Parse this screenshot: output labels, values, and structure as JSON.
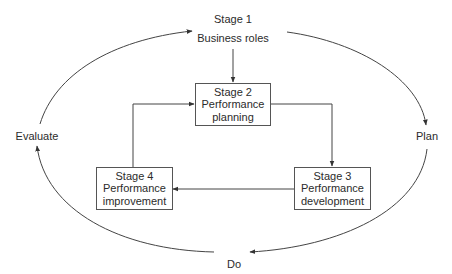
{
  "diagram": {
    "type": "cycle-flow",
    "outer_cycle": {
      "stage1": {
        "title": "Stage 1",
        "subtitle": "Business roles"
      },
      "phases": [
        {
          "label": "Plan"
        },
        {
          "label": "Do"
        },
        {
          "label": "Evaluate"
        }
      ]
    },
    "inner_cycle": {
      "boxes": [
        {
          "id": "stage2",
          "title": "Stage 2",
          "line1": "Performance",
          "line2": "planning"
        },
        {
          "id": "stage3",
          "title": "Stage 3",
          "line1": "Performance",
          "line2": "development"
        },
        {
          "id": "stage4",
          "title": "Stage 4",
          "line1": "Performance",
          "line2": "improvement"
        }
      ]
    },
    "edges": [
      {
        "from": "Stage 1",
        "to": "Stage 2"
      },
      {
        "from": "Stage 2",
        "to": "Stage 3"
      },
      {
        "from": "Stage 3",
        "to": "Stage 4"
      },
      {
        "from": "Stage 4",
        "to": "Stage 2"
      },
      {
        "from": "Stage 1",
        "to": "Plan"
      },
      {
        "from": "Plan",
        "to": "Do"
      },
      {
        "from": "Do",
        "to": "Evaluate"
      },
      {
        "from": "Evaluate",
        "to": "Stage 1"
      }
    ],
    "colors": {
      "line": "#444444",
      "text": "#2b2b2b",
      "background": "#ffffff"
    }
  }
}
